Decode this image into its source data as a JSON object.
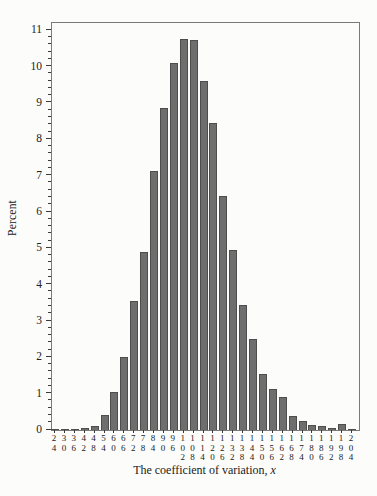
{
  "figure": {
    "ylabel": "Percent",
    "xlabel_prefix": "The coefficient of variation, ",
    "xlabel_var": "x"
  },
  "chart_data": {
    "type": "bar",
    "title": "",
    "xlabel": "The coefficient of variation, x",
    "ylabel": "Percent",
    "categories": [
      24,
      30,
      36,
      42,
      48,
      54,
      60,
      66,
      72,
      78,
      84,
      90,
      96,
      102,
      108,
      114,
      120,
      126,
      132,
      138,
      144,
      150,
      156,
      162,
      168,
      174,
      180,
      186,
      192,
      198,
      204
    ],
    "values": [
      0.03,
      0.03,
      0.02,
      0.05,
      0.1,
      0.42,
      1.05,
      2.0,
      3.55,
      4.9,
      7.12,
      8.85,
      10.1,
      10.76,
      10.72,
      9.6,
      8.45,
      6.45,
      4.95,
      3.45,
      2.5,
      1.55,
      1.12,
      0.9,
      0.38,
      0.26,
      0.15,
      0.1,
      0.05,
      0.17,
      0.03
    ],
    "ylim": [
      0,
      11
    ],
    "yaxis_frame_max": 11.2,
    "ytick_step": 1,
    "yminor_step": 0.2,
    "grid": false,
    "legend": "none",
    "bar_color": "#6e6e6e",
    "bar_edge_color": "#4d4d4d",
    "frame_color": "#7a7a7a",
    "tick_color": "#3a3a3a",
    "background_color": "#fcfcfa"
  }
}
